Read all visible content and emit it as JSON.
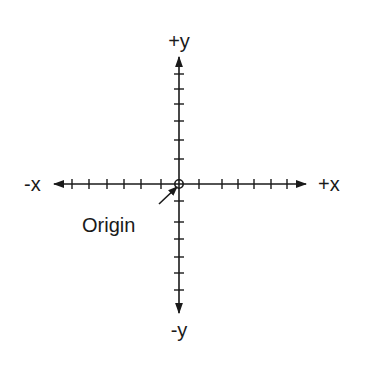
{
  "diagram": {
    "labels": {
      "pos_y": "+y",
      "neg_y": "-y",
      "pos_x": "+x",
      "neg_x": "-x",
      "origin": "Origin"
    },
    "colors": {
      "line": "#1a1a1a",
      "background": "#ffffff"
    },
    "ticks_per_half_axis": 6
  }
}
